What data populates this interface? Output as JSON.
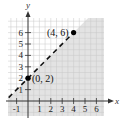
{
  "chart_data": {
    "type": "line",
    "title": "",
    "xlabel": "x",
    "ylabel": "y",
    "xlim": [
      -1.75,
      6.7
    ],
    "ylim": [
      -1.2,
      7.2
    ],
    "grid": true,
    "grid_step": 0.5,
    "x_ticks": [
      -1,
      1,
      2,
      3,
      4,
      5,
      6
    ],
    "x_tick_labels": [
      "-1",
      "1",
      "2",
      "3",
      "4",
      "5",
      "6"
    ],
    "y_ticks": [
      1,
      2,
      3,
      4,
      5,
      6
    ],
    "y_tick_labels": [
      "1",
      "2",
      "3",
      "4",
      "5",
      "6"
    ],
    "boundary_line": {
      "equation": "y = x + 2",
      "slope": 1,
      "intercept": 2,
      "style": "dashed",
      "x_range": [
        -1.7,
        4
      ]
    },
    "shaded_region": {
      "description": "y < x + 2 (below/right of dashed line)",
      "color": "#e3e3e3"
    },
    "points": [
      {
        "x": 0,
        "y": 2,
        "label": "(0, 2)"
      },
      {
        "x": 4,
        "y": 6,
        "label": "(4, 6)"
      }
    ],
    "colors": {
      "shade": "#e3e3e3",
      "grid": "#c8c8c8",
      "axis": "#333333",
      "line": "#111111",
      "point": "#000000"
    }
  }
}
